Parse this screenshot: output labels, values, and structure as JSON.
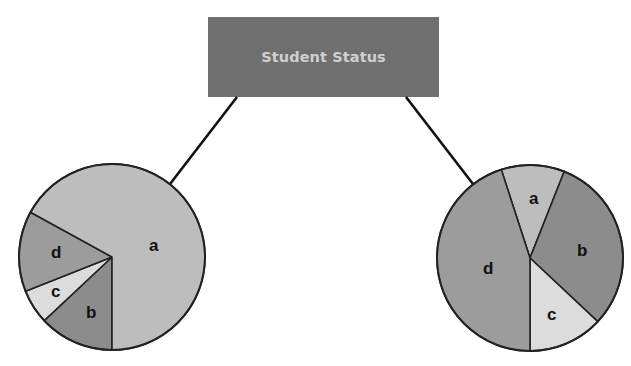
{
  "title": "Student Status",
  "colors": {
    "title_box": "#6f6f6f",
    "title_text": "#cfcfcf",
    "connector": "#111111",
    "outline": "#222222",
    "a": "#bdbdbd",
    "b": "#8c8c8c",
    "c": "#dcdcdc",
    "d": "#9c9c9c"
  },
  "chart_data": [
    {
      "type": "pie",
      "title": "Student Status (left)",
      "categories": [
        "a",
        "b",
        "c",
        "d"
      ],
      "values": [
        67,
        13,
        6,
        14
      ],
      "unit": "percent (estimated from slice angles)"
    },
    {
      "type": "pie",
      "title": "Student Status (right)",
      "categories": [
        "a",
        "b",
        "c",
        "d"
      ],
      "values": [
        11,
        31,
        13,
        45
      ],
      "unit": "percent (estimated from slice angles)"
    }
  ],
  "pies": {
    "left": {
      "labels": {
        "a": "a",
        "b": "b",
        "c": "c",
        "d": "d"
      }
    },
    "right": {
      "labels": {
        "a": "a",
        "b": "b",
        "c": "c",
        "d": "d"
      }
    }
  }
}
